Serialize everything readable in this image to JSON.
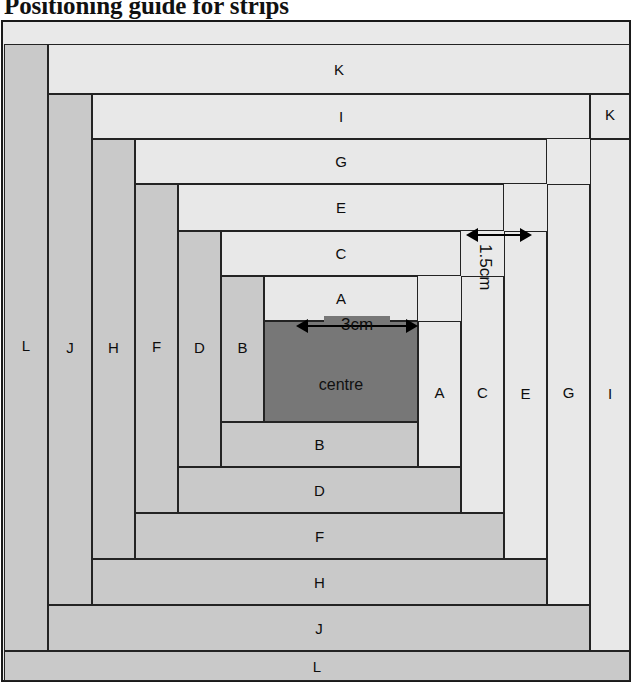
{
  "title": "Positioning guide for strips",
  "diagram": {
    "kind": "log-cabin-quilt-block-layout",
    "centre": {
      "label": "centre",
      "size_label": "3cm",
      "color": "#777777"
    },
    "strip_width_label": "1.5cm",
    "colors": {
      "light_strip": "#e8e8e8",
      "mid_strip": "#c9c9c9",
      "centre": "#777777",
      "outline": "#232323",
      "frame": "#1a1a1a",
      "background": "#e9e9e9"
    },
    "annotations": [
      {
        "name": "centre-width",
        "text": "3cm",
        "orientation": "horizontal"
      },
      {
        "name": "strip-width",
        "text": "1.5cm",
        "orientation": "vertical"
      }
    ],
    "strips": [
      {
        "id": "K-top",
        "label": "K",
        "tone": "light",
        "orient": "horz",
        "x": 48,
        "y": 25,
        "w": 582,
        "h": 50
      },
      {
        "id": "I-top",
        "label": "I",
        "tone": "light",
        "orient": "horz",
        "x": 92,
        "y": 75,
        "w": 498,
        "h": 45
      },
      {
        "id": "G-top",
        "label": "G",
        "tone": "light",
        "orient": "horz",
        "x": 135,
        "y": 120,
        "w": 412,
        "h": 45
      },
      {
        "id": "E-top",
        "label": "E",
        "tone": "light",
        "orient": "horz",
        "x": 178,
        "y": 165,
        "w": 326,
        "h": 47
      },
      {
        "id": "C-top",
        "label": "C",
        "tone": "light",
        "orient": "horz",
        "x": 221,
        "y": 212,
        "w": 240,
        "h": 45
      },
      {
        "id": "A-top",
        "label": "A",
        "tone": "light",
        "orient": "horz",
        "x": 264,
        "y": 257,
        "w": 154,
        "h": 45
      },
      {
        "id": "B-bottom",
        "label": "B",
        "tone": "mid",
        "orient": "horz",
        "x": 221,
        "y": 403,
        "w": 197,
        "h": 45
      },
      {
        "id": "D-bottom",
        "label": "D",
        "tone": "mid",
        "orient": "horz",
        "x": 178,
        "y": 448,
        "w": 283,
        "h": 46
      },
      {
        "id": "F-bottom",
        "label": "F",
        "tone": "mid",
        "orient": "horz",
        "x": 135,
        "y": 494,
        "w": 369,
        "h": 46
      },
      {
        "id": "H-bottom",
        "label": "H",
        "tone": "mid",
        "orient": "horz",
        "x": 92,
        "y": 540,
        "w": 455,
        "h": 46
      },
      {
        "id": "J-bottom",
        "label": "J",
        "tone": "mid",
        "orient": "horz",
        "x": 48,
        "y": 586,
        "w": 542,
        "h": 46
      },
      {
        "id": "L-bottom",
        "label": "L",
        "tone": "mid",
        "orient": "horz",
        "x": 4,
        "y": 632,
        "w": 626,
        "h": 30
      },
      {
        "id": "L-left",
        "label": "L",
        "tone": "mid",
        "orient": "vert",
        "x": 4,
        "y": 25,
        "w": 44,
        "h": 607
      },
      {
        "id": "J-left",
        "label": "J",
        "tone": "mid",
        "orient": "vert",
        "x": 48,
        "y": 75,
        "w": 44,
        "h": 511
      },
      {
        "id": "H-left",
        "label": "H",
        "tone": "mid",
        "orient": "vert",
        "x": 92,
        "y": 120,
        "w": 43,
        "h": 420
      },
      {
        "id": "F-left",
        "label": "F",
        "tone": "mid",
        "orient": "vert",
        "x": 135,
        "y": 165,
        "w": 43,
        "h": 329
      },
      {
        "id": "D-left",
        "label": "D",
        "tone": "mid",
        "orient": "vert",
        "x": 178,
        "y": 212,
        "w": 43,
        "h": 236
      },
      {
        "id": "B-left",
        "label": "B",
        "tone": "mid",
        "orient": "vert",
        "x": 221,
        "y": 257,
        "w": 43,
        "h": 146
      },
      {
        "id": "A-right",
        "label": "A",
        "tone": "light",
        "orient": "vert",
        "x": 418,
        "y": 302,
        "w": 43,
        "h": 146
      },
      {
        "id": "C-right",
        "label": "C",
        "tone": "light",
        "orient": "vert",
        "x": 461,
        "y": 257,
        "w": 43,
        "h": 237
      },
      {
        "id": "E-right",
        "label": "E",
        "tone": "light",
        "orient": "vert",
        "x": 504,
        "y": 212,
        "w": 43,
        "h": 328
      },
      {
        "id": "G-right",
        "label": "G",
        "tone": "light",
        "orient": "vert",
        "x": 547,
        "y": 165,
        "w": 43,
        "h": 421
      },
      {
        "id": "I-right",
        "label": "I",
        "tone": "light",
        "orient": "vert",
        "x": 590,
        "y": 120,
        "w": 40,
        "h": 512
      },
      {
        "id": "K-right",
        "label": "K",
        "tone": "light",
        "orient": "vert",
        "x": 590,
        "y": 75,
        "w": 40,
        "h": 45
      },
      {
        "id": "centre",
        "label": "centre",
        "tone": "centre",
        "orient": "sq",
        "x": 264,
        "y": 302,
        "w": 154,
        "h": 101
      }
    ],
    "label_rows": {
      "middle_row_order": [
        "L",
        "J",
        "H",
        "F",
        "D",
        "B",
        "centre",
        "A",
        "C",
        "E",
        "G",
        "I",
        "K"
      ],
      "top_column_order": [
        "K",
        "I",
        "G",
        "E",
        "C",
        "A"
      ],
      "bottom_column_order": [
        "B",
        "D",
        "F",
        "H",
        "J",
        "L"
      ]
    }
  }
}
